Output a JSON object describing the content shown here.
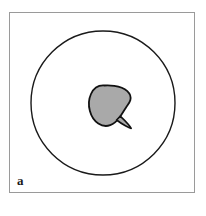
{
  "figure": {
    "panel_label": "a",
    "frame": {
      "border_color": "#9a9a9a",
      "background_color": "#ffffff"
    },
    "circle": {
      "name": "outer-circle-outline",
      "stroke_color": "#1a1a1a",
      "fill_color": "none",
      "center_x": 103,
      "center_y": 103,
      "radius": 72,
      "stroke_width": 1.4
    },
    "blob": {
      "name": "teardrop-region",
      "fill_color": "#a9a9a9",
      "stroke_color": "#111111",
      "stroke_width": 1.8,
      "description": "teardrop shape with tail pointing lower-right"
    }
  }
}
